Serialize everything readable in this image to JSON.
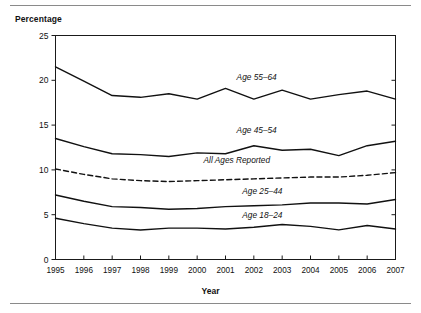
{
  "figure": {
    "y_axis_title": "Percentage",
    "x_axis_title": "Year"
  },
  "chart_data": {
    "type": "line",
    "title": "",
    "subtitle": "",
    "xlabel": "Year",
    "ylabel": "Percentage",
    "x": [
      1995,
      1996,
      1997,
      1998,
      1999,
      2000,
      2001,
      2002,
      2003,
      2004,
      2005,
      2006,
      2007
    ],
    "xtick_labels": [
      "1995",
      "1996",
      "1997",
      "1998",
      "1999",
      "2000",
      "2001",
      "2002",
      "2003",
      "2004",
      "2005",
      "2006",
      "2007"
    ],
    "ytick_labels": [
      "0",
      "5",
      "10",
      "15",
      "20",
      "25"
    ],
    "yticks": [
      0,
      5,
      10,
      15,
      20,
      25
    ],
    "xlim": [
      1995,
      2007
    ],
    "ylim": [
      0,
      25
    ],
    "grid": false,
    "legend_position": "inline-annotations",
    "series": [
      {
        "name": "Age 55–64",
        "label": "Age 55–64",
        "style": "solid",
        "label_x": 2002.1,
        "label_y": 20.0,
        "values": [
          21.5,
          19.9,
          18.3,
          18.1,
          18.5,
          17.9,
          19.1,
          17.9,
          18.9,
          17.9,
          18.4,
          18.8,
          17.9
        ]
      },
      {
        "name": "Age 45–54",
        "label": "Age 45–54",
        "style": "solid",
        "label_x": 2002.1,
        "label_y": 14.1,
        "values": [
          13.5,
          12.6,
          11.8,
          11.7,
          11.5,
          11.9,
          11.8,
          12.7,
          12.2,
          12.3,
          11.6,
          12.7,
          13.2
        ]
      },
      {
        "name": "All Ages Reported",
        "label": "All Ages Reported",
        "style": "dashed",
        "label_x": 2001.4,
        "label_y": 10.8,
        "values": [
          10.1,
          9.5,
          9.0,
          8.8,
          8.7,
          8.8,
          8.9,
          9.0,
          9.1,
          9.2,
          9.2,
          9.4,
          9.7
        ]
      },
      {
        "name": "Age 25–44",
        "label": "Age 25–44",
        "style": "solid",
        "label_x": 2002.3,
        "label_y": 7.3,
        "values": [
          7.2,
          6.5,
          5.9,
          5.8,
          5.6,
          5.7,
          5.9,
          6.0,
          6.1,
          6.3,
          6.3,
          6.2,
          6.7
        ]
      },
      {
        "name": "Age 18–24",
        "label": "Age 18–24",
        "style": "solid",
        "label_x": 2002.3,
        "label_y": 4.6,
        "values": [
          4.6,
          4.0,
          3.5,
          3.3,
          3.5,
          3.5,
          3.4,
          3.6,
          3.9,
          3.7,
          3.3,
          3.8,
          3.4
        ]
      }
    ]
  }
}
